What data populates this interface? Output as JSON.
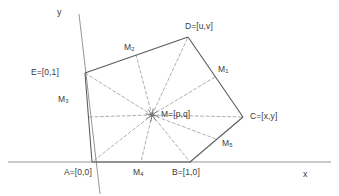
{
  "figure": {
    "background": "#ffffff",
    "stroke_solid": "#5a5a5a",
    "stroke_dashed": "#9a9a9a",
    "axis_color": "#8a8a8a",
    "text_color": "#3a3a3a"
  },
  "axes": {
    "x_label": "x",
    "y_label": "y",
    "x_label_pos": [
      303,
      170
    ],
    "y_label_pos": [
      57,
      8
    ],
    "x_axis": {
      "x1": 8,
      "y1": 162,
      "x2": 331,
      "y2": 162
    },
    "y_axis": {
      "x1": 79,
      "y1": 14,
      "x2": 100,
      "y2": 194
    }
  },
  "vertices": [
    {
      "id": "A",
      "label": "A=[0,0]",
      "x": 92,
      "y": 162,
      "label_x": 64,
      "label_y": 168
    },
    {
      "id": "B",
      "label": "B=[1,0]",
      "x": 190,
      "y": 162,
      "label_x": 172,
      "label_y": 168
    },
    {
      "id": "C",
      "label": "C=[x,y]",
      "x": 243,
      "y": 117,
      "label_x": 250,
      "label_y": 112
    },
    {
      "id": "D",
      "label": "D=[u,v]",
      "x": 188,
      "y": 37,
      "label_x": 185,
      "label_y": 22
    },
    {
      "id": "E",
      "label": "E=[0,1]",
      "x": 85,
      "y": 73,
      "label_x": 31,
      "label_y": 68
    }
  ],
  "center": {
    "id": "M",
    "label": "M=[p,q]",
    "sub": "",
    "x": 152,
    "y": 115,
    "label_x": 161,
    "label_y": 110,
    "marker": "asterisk-star"
  },
  "midpoints": [
    {
      "id": "M1",
      "base": "M",
      "sub": "1",
      "edge": "C-D",
      "x": 215,
      "y": 77,
      "label_x": 218,
      "label_y": 65
    },
    {
      "id": "M2",
      "base": "M",
      "sub": "2",
      "edge": "D-E",
      "x": 136,
      "y": 55,
      "label_x": 124,
      "label_y": 43
    },
    {
      "id": "M3",
      "base": "M",
      "sub": "3",
      "edge": "E-A",
      "x": 88,
      "y": 117,
      "label_x": 58,
      "label_y": 95
    },
    {
      "id": "M4",
      "base": "M",
      "sub": "4",
      "edge": "A-B",
      "x": 141,
      "y": 162,
      "label_x": 133,
      "label_y": 168
    },
    {
      "id": "M5",
      "base": "M",
      "sub": "5",
      "edge": "B-C",
      "x": 216,
      "y": 139,
      "label_x": 222,
      "label_y": 139
    }
  ],
  "edges": [
    {
      "from": "A",
      "to": "B"
    },
    {
      "from": "B",
      "to": "C"
    },
    {
      "from": "C",
      "to": "D"
    },
    {
      "from": "D",
      "to": "E"
    },
    {
      "from": "E",
      "to": "A"
    }
  ],
  "spokes_to_vertices": [
    "A",
    "B",
    "C",
    "D",
    "E"
  ],
  "spokes_to_midpoints": [
    "M1",
    "M2",
    "M3",
    "M4",
    "M5"
  ]
}
